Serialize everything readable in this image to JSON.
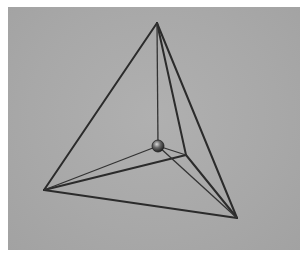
{
  "image": {
    "subject": "wire-frame tetrahedron sculpture with a small metal sphere at its center",
    "background_color": "#a9a9a9",
    "frame_color": "#ffffff",
    "wire_color": "#2a2a2a",
    "vertices": {
      "top": [
        157,
        23
      ],
      "left": [
        44,
        190
      ],
      "right": [
        237,
        218
      ],
      "inner": [
        186,
        155
      ],
      "sphere": [
        158,
        146
      ]
    },
    "sphere_radius": 6
  }
}
